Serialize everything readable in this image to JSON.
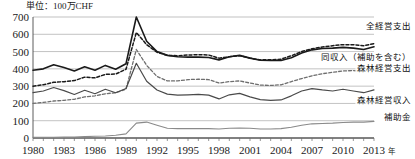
{
  "chart_data": {
    "type": "line",
    "title": "",
    "unit_label": "単位：100万CHF",
    "xlabel": "年",
    "ylabel": "",
    "ylim": [
      0,
      700
    ],
    "ytick_values": [
      0,
      100,
      200,
      300,
      400,
      500,
      600,
      700
    ],
    "ytick_labels": [
      "0",
      "100",
      "200",
      "300",
      "400",
      "500",
      "600",
      "700"
    ],
    "grid": true,
    "legend_position": "inline-right",
    "xlim": [
      1980,
      2013
    ],
    "x": [
      1980,
      1981,
      1982,
      1983,
      1984,
      1985,
      1986,
      1987,
      1988,
      1989,
      1990,
      1991,
      1992,
      1993,
      1994,
      1995,
      1996,
      1997,
      1998,
      1999,
      2000,
      2001,
      2002,
      2003,
      2004,
      2005,
      2006,
      2007,
      2008,
      2009,
      2010,
      2011,
      2012,
      2013
    ],
    "xtick_values": [
      1980,
      1983,
      1986,
      1989,
      1992,
      1995,
      1998,
      2001,
      2004,
      2007,
      2010,
      2013
    ],
    "xtick_labels": [
      "1980",
      "1983",
      "1986",
      "1989",
      "1992",
      "1995",
      "1998",
      "2001",
      "2004",
      "2007",
      "2010",
      "2013"
    ],
    "series": [
      {
        "name": "全経営支出",
        "label": "全経営支出",
        "style": "solid",
        "color": "#1a1a1a",
        "width": 1.6,
        "label_x": 2013,
        "label_y": 632,
        "values": [
          392,
          400,
          424,
          408,
          388,
          412,
          392,
          420,
          398,
          430,
          700,
          560,
          500,
          478,
          470,
          468,
          468,
          466,
          452,
          470,
          478,
          462,
          450,
          448,
          448,
          464,
          492,
          510,
          518,
          520,
          524,
          520,
          512,
          528
        ]
      },
      {
        "name": "同収入（補助を含む）",
        "label": "同収入（補助を含む）",
        "style": "dashed",
        "color": "#1a1a1a",
        "width": 1.5,
        "label_x": 2013,
        "label_y": 452,
        "values": [
          300,
          308,
          322,
          326,
          332,
          352,
          348,
          368,
          370,
          398,
          610,
          540,
          496,
          478,
          476,
          480,
          482,
          480,
          462,
          470,
          476,
          462,
          452,
          452,
          456,
          476,
          500,
          516,
          526,
          534,
          540,
          540,
          534,
          546
        ]
      },
      {
        "name": "森林経営支出",
        "label": "森林経営支出",
        "style": "dashed",
        "color": "#6e6e6e",
        "width": 1.3,
        "label_x": 2013,
        "label_y": 390,
        "values": [
          200,
          206,
          214,
          218,
          224,
          238,
          244,
          256,
          262,
          282,
          512,
          420,
          356,
          330,
          330,
          338,
          340,
          338,
          318,
          326,
          330,
          318,
          306,
          304,
          308,
          326,
          344,
          360,
          372,
          380,
          388,
          390,
          386,
          398
        ]
      },
      {
        "name": "森林経営収入",
        "label": "森林経営収入",
        "style": "solid",
        "color": "#4a4a4a",
        "width": 1.2,
        "label_x": 2013,
        "label_y": 205,
        "values": [
          262,
          272,
          292,
          274,
          252,
          276,
          256,
          282,
          262,
          286,
          432,
          328,
          278,
          254,
          248,
          250,
          252,
          248,
          226,
          250,
          258,
          238,
          222,
          218,
          220,
          244,
          272,
          286,
          278,
          272,
          282,
          272,
          262,
          278
        ]
      },
      {
        "name": "補助金",
        "label": "補助金",
        "style": "solid",
        "color": "#8a8a8a",
        "width": 1.1,
        "label_x": 2013,
        "label_y": 106,
        "values": [
          4,
          4,
          4,
          5,
          6,
          8,
          10,
          12,
          16,
          24,
          86,
          92,
          74,
          56,
          54,
          54,
          54,
          54,
          52,
          56,
          58,
          56,
          52,
          52,
          54,
          62,
          74,
          82,
          84,
          86,
          90,
          92,
          92,
          96
        ]
      }
    ]
  }
}
